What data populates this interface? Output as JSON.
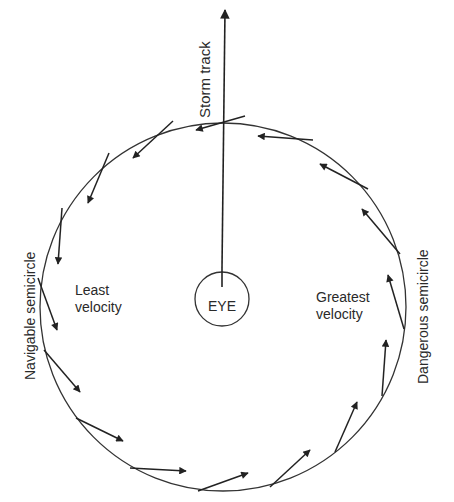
{
  "diagram": {
    "storm_track_label": "Storm track",
    "eye_label": "EYE",
    "left_semicircle_label": "Navigable semicircle",
    "right_semicircle_label": "Dangerous semicircle",
    "left_velocity_label": [
      "Least",
      "velocity"
    ],
    "right_velocity_label": [
      "Greatest",
      "velocity"
    ],
    "wind_direction": "counter-clockwise",
    "arrow_count": 16,
    "colors": {
      "line": "#2a2a2a",
      "background": "#ffffff"
    }
  }
}
